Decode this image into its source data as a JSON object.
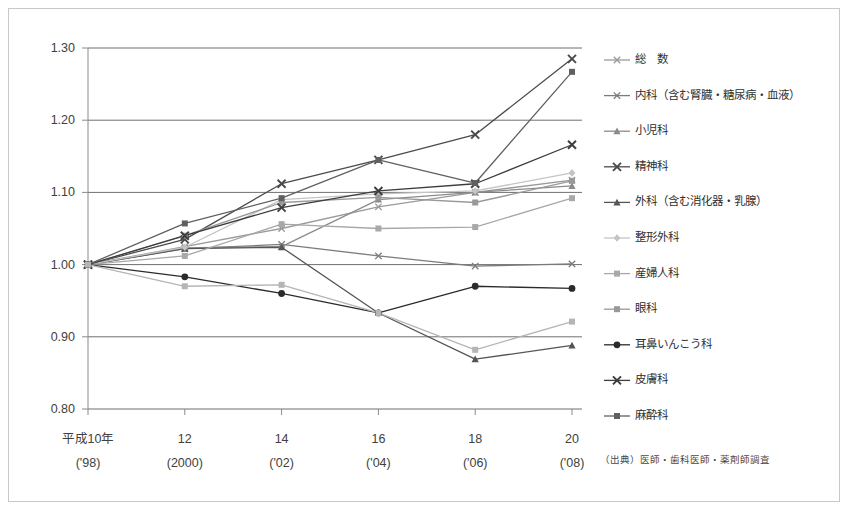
{
  "chart_data": {
    "type": "line",
    "title": "",
    "subtitle": "",
    "xlabel": "",
    "ylabel": "",
    "ylim": [
      0.8,
      1.3
    ],
    "ytick_values": [
      0.8,
      0.9,
      1.0,
      1.1,
      1.2,
      1.3
    ],
    "ytick_labels": [
      "0.80",
      "0.90",
      "1.00",
      "1.10",
      "1.20",
      "1.30"
    ],
    "grid": "horizontal",
    "legend_position": "right",
    "x": [
      1998,
      2000,
      2002,
      2004,
      2006,
      2008
    ],
    "categories": [
      "平成10年",
      "12",
      "14",
      "16",
      "18",
      "20"
    ],
    "xtick_labels_top": [
      "平成10年",
      "12",
      "14",
      "16",
      "18",
      "20"
    ],
    "xtick_labels_bottom": [
      "('98)",
      "(2000)",
      "('02)",
      "('04)",
      "('06)",
      "('08)"
    ],
    "source_note": "（出典）医師・歯科医師・薬剤師調査",
    "series": [
      {
        "name": "総　数",
        "marker": "cross-small",
        "color": "#9a9a9a",
        "values": [
          1.0,
          1.025,
          1.05,
          1.08,
          1.1,
          1.117
        ]
      },
      {
        "name": "内科（含む腎臓・糖尿病・血液）",
        "marker": "cross-small",
        "color": "#7c7c7c",
        "values": [
          1.0,
          1.022,
          1.028,
          1.012,
          0.998,
          1.001
        ]
      },
      {
        "name": "小児科",
        "marker": "triangle",
        "color": "#8b8b8b",
        "values": [
          1.0,
          1.023,
          1.025,
          1.09,
          1.1,
          1.109
        ]
      },
      {
        "name": "精神科",
        "marker": "cross-bold",
        "color": "#4a4a4a",
        "values": [
          1.0,
          1.035,
          1.112,
          1.145,
          1.18,
          1.285
        ]
      },
      {
        "name": "外科（含む消化器・乳腺）",
        "marker": "triangle",
        "color": "#555555",
        "values": [
          1.0,
          1.022,
          1.024,
          0.933,
          0.869,
          0.888
        ]
      },
      {
        "name": "整形外科",
        "marker": "diamond",
        "color": "#c4c4c4",
        "values": [
          1.0,
          1.024,
          1.09,
          1.098,
          1.102,
          1.127
        ]
      },
      {
        "name": "産婦人科",
        "marker": "square",
        "color": "#a8a8a8",
        "values": [
          1.0,
          1.012,
          1.056,
          1.05,
          1.052,
          1.092
        ]
      },
      {
        "name": "眼科",
        "marker": "square",
        "color": "#999999",
        "values": [
          1.0,
          1.04,
          1.086,
          1.093,
          1.086,
          1.116
        ]
      },
      {
        "name": "耳鼻いんこう科",
        "marker": "circle",
        "color": "#2b2b2b",
        "values": [
          1.0,
          0.983,
          0.96,
          0.933,
          0.97,
          0.967
        ]
      },
      {
        "name": "皮膚科",
        "marker": "cross-bold",
        "color": "#3d3d3d",
        "values": [
          1.0,
          1.04,
          1.079,
          1.102,
          1.112,
          1.166
        ]
      },
      {
        "name": "麻酔科",
        "marker": "square",
        "color": "#606060",
        "values": [
          1.0,
          1.057,
          1.092,
          1.145,
          1.113,
          1.267
        ]
      }
    ],
    "secondary_series": [
      {
        "name": "産婦人科-low",
        "marker": "square",
        "color": "#b5b5b5",
        "values": [
          1.0,
          0.97,
          0.972,
          0.933,
          0.882,
          0.921
        ]
      }
    ]
  }
}
